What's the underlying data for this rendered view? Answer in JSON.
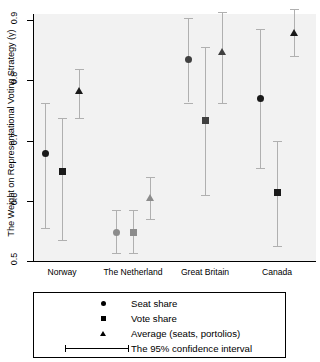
{
  "chart_data": {
    "type": "scatter",
    "title": "",
    "xlabel": "",
    "ylabel": "The Weight on Representational Voting Strategy (γ)",
    "ylim": [
      0.5,
      0.9
    ],
    "yticks": [
      "0.5",
      "0.6",
      "0.7",
      "0.8",
      "0.9"
    ],
    "ytick_values": [
      0.5,
      0.6,
      0.7,
      0.8,
      0.9
    ],
    "grid": false,
    "legend_position": "below-plot",
    "categories": [
      "Norway",
      "The Netherland",
      "Great Britain",
      "Canada"
    ],
    "series": [
      {
        "name": "Seat share",
        "marker": "circle",
        "values": [
          0.678,
          0.548,
          0.834,
          0.77
        ],
        "ci_low": [
          0.555,
          0.513,
          0.763,
          0.655
        ],
        "ci_high": [
          0.763,
          0.585,
          0.903,
          0.885
        ],
        "colors": [
          "#1a1a1a",
          "#8c8c8c",
          "#404040",
          "#1a1a1a"
        ]
      },
      {
        "name": "Vote share",
        "marker": "square",
        "values": [
          0.648,
          0.548,
          0.733,
          0.613
        ],
        "ci_low": [
          0.535,
          0.513,
          0.61,
          0.525
        ],
        "ci_high": [
          0.737,
          0.585,
          0.855,
          0.7
        ],
        "colors": [
          "#1a1a1a",
          "#8c8c8c",
          "#404040",
          "#1a1a1a"
        ]
      },
      {
        "name": "Average (seats, portolios)",
        "marker": "triangle",
        "values": [
          0.783,
          0.605,
          0.848,
          0.88
        ],
        "ci_low": [
          0.737,
          0.57,
          0.763,
          0.84
        ],
        "ci_high": [
          0.818,
          0.64,
          0.913,
          0.918
        ],
        "colors": [
          "#1a1a1a",
          "#8c8c8c",
          "#404040",
          "#1a1a1a"
        ]
      }
    ],
    "error_bar_note": "The 95% confidence interval"
  },
  "legend": {
    "entries": [
      {
        "symbol": "circle-marker",
        "label": "Seat share"
      },
      {
        "symbol": "square-marker",
        "label": "Vote share"
      },
      {
        "symbol": "triangle-marker",
        "label": "Average (seats, portolios)"
      },
      {
        "symbol": "errorbar-marker",
        "label": "The 95% confidence interval"
      }
    ]
  },
  "colors": {
    "panel_background": "#f2f2f2",
    "axis": "#000000",
    "marker_dark": "#1a1a1a",
    "marker_gray": "#8c8c8c",
    "errorbar": "#b0b0b0"
  }
}
